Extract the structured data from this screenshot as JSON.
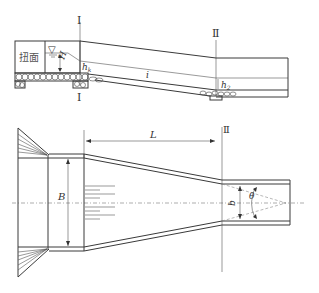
{
  "figure": {
    "type": "channel drop / chute with warped transition diagram",
    "profile_view": {
      "section_labels": {
        "section_1_top": "Ⅰ",
        "section_1_bottom": "Ⅰ",
        "section_2_top": "Ⅱ"
      },
      "transition_label": "扭面",
      "water_surface_symbol": "▽",
      "head_label": "H",
      "critical_depth_label": "h",
      "critical_depth_subscript": "k",
      "slope_label": "i",
      "end_depth_label": "h",
      "end_depth_subscript": "2"
    },
    "plan_view": {
      "length_label": "L",
      "section_2_label": "Ⅱ",
      "width_label": "B",
      "end_width_label": "b",
      "angle_label": "θ"
    }
  }
}
